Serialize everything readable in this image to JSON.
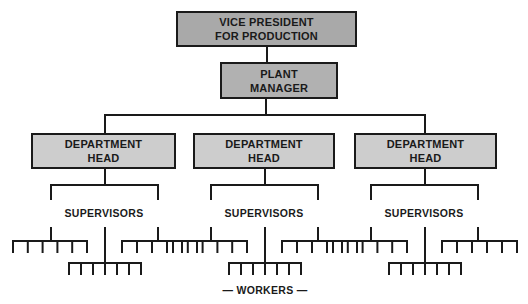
{
  "chart": {
    "colors": {
      "top_box": "#a9a9a9",
      "plant_box": "#b1b1b1",
      "dept_box": "#cdcdcd",
      "line": "#1a1a1a"
    },
    "vice_president": {
      "line1": "VICE PRESIDENT",
      "line2": "FOR PRODUCTION"
    },
    "plant_manager": {
      "line1": "PLANT",
      "line2": "MANAGER"
    },
    "departments": [
      {
        "line1": "DEPARTMENT",
        "line2": "HEAD",
        "supervisors_label": "SUPERVISORS"
      },
      {
        "line1": "DEPARTMENT",
        "line2": "HEAD",
        "supervisors_label": "SUPERVISORS"
      },
      {
        "line1": "DEPARTMENT",
        "line2": "HEAD",
        "supervisors_label": "SUPERVISORS"
      }
    ],
    "workers_label": "— WORKERS —",
    "workers_per_group": {
      "upper_left": 6,
      "upper_right": 6,
      "lower": 7
    }
  }
}
